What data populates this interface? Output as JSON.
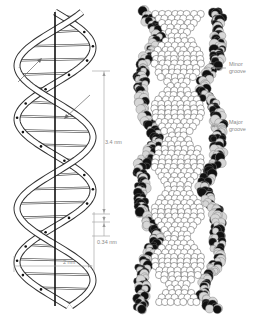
{
  "figure": {
    "type": "DNA double helix illustration",
    "left_panel": {
      "name": "ribbon-and-stick model",
      "axis_label": "",
      "annotations": [
        {
          "id": "helical_pitch",
          "text": "3.4 nm"
        },
        {
          "id": "base_pair_rise",
          "text": "0.34 nm"
        },
        {
          "id": "helix_diameter",
          "text": "2 nm"
        }
      ]
    },
    "right_panel": {
      "name": "space-filling model",
      "annotations": [
        {
          "id": "minor_groove",
          "text": "Minor groove"
        },
        {
          "id": "major_groove",
          "text": "Major groove"
        }
      ]
    },
    "colors": {
      "strand_outline": "#333333",
      "strand_fill": "#ffffff",
      "axis": "#111111",
      "dimension_lines": "#9a9a9a",
      "label_text": "#8a8a8a",
      "atom_light": "#d6d6d6",
      "atom_white": "#ffffff",
      "atom_dark": "#111111"
    }
  },
  "labels": {
    "pitch": "3.4 nm",
    "rise": "0.34 nm",
    "diameter": "2 nm",
    "minor_groove": "Minor groove",
    "major_groove": "Major groove"
  }
}
